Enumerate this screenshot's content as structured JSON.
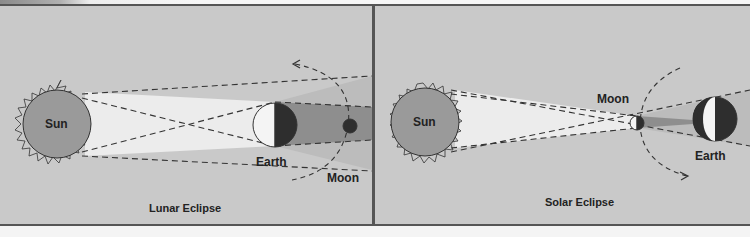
{
  "figure": {
    "panels": [
      {
        "id": "lunar",
        "caption": "Lunar Eclipse",
        "labels": {
          "sun": "Sun",
          "earth": "Earth",
          "moon": "Moon"
        }
      },
      {
        "id": "solar",
        "caption": "Solar Eclipse",
        "labels": {
          "sun": "Sun",
          "moon": "Moon",
          "earth": "Earth"
        }
      }
    ],
    "colors": {
      "background": "#c9c9c9",
      "sun_fill": "#9a9a9a",
      "light_cone": "#ececec",
      "umbra": "#8e8e8e",
      "penumbra": "#b8b8b8",
      "dark_side": "#2e2e2e",
      "lit_side": "#f4f4f4",
      "border": "#555555"
    }
  }
}
